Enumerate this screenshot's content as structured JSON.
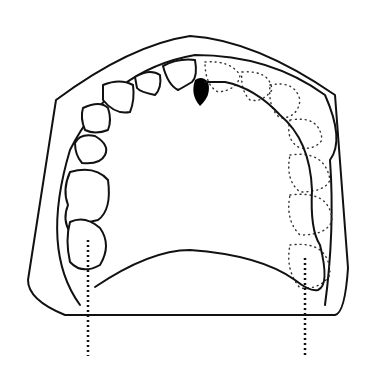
{
  "diagram": {
    "elements": [
      "cast-base",
      "dental-arch",
      "remaining-teeth-right",
      "missing-teeth-outline-left",
      "palate-outline",
      "abutment-marker",
      "reference-lines"
    ],
    "marker_color": "#000000",
    "line_color": "#111111"
  }
}
